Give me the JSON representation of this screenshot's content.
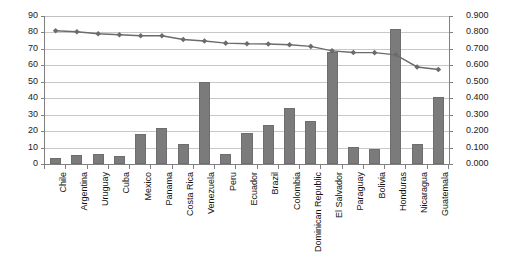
{
  "chart_data": {
    "type": "bar",
    "title": "",
    "subtitle": "",
    "xlabel": "",
    "ylabel": "",
    "grid": true,
    "legend": "none",
    "categories": [
      "Chile",
      "Argentina",
      "Uruguay",
      "Cuba",
      "Mexico",
      "Panama",
      "Costa Rica",
      "Venezuela",
      "Peru",
      "Ecuador",
      "Brazil",
      "Colombia",
      "Dominican Republic",
      "El Salvador",
      "Paraguay",
      "Bolivia",
      "Honduras",
      "Nicaragua",
      "Guatemala"
    ],
    "axes": {
      "left": {
        "min": 0,
        "max": 90,
        "step": 10,
        "ticks": [
          "0",
          "10",
          "20",
          "30",
          "40",
          "50",
          "60",
          "70",
          "80",
          "90"
        ]
      },
      "right": {
        "min": 0.0,
        "max": 0.9,
        "step": 0.1,
        "ticks": [
          "0.000",
          "0.100",
          "0.200",
          "0.300",
          "0.400",
          "0.500",
          "0.600",
          "0.700",
          "0.800",
          "0.900"
        ]
      }
    },
    "series": [
      {
        "name": "bars",
        "type": "bar",
        "axis": "left",
        "color": "#7b7b7b",
        "values": [
          3.4,
          5.5,
          6.3,
          4.9,
          18.5,
          22.0,
          12.0,
          49.7,
          6.0,
          19.1,
          23.6,
          34.1,
          26.0,
          68.0,
          10.4,
          8.9,
          82.0,
          12.4,
          41.0
        ]
      },
      {
        "name": "line",
        "type": "line",
        "axis": "right",
        "color": "#6b6b6b",
        "marker": "diamond",
        "values": [
          0.81,
          0.804,
          0.792,
          0.786,
          0.78,
          0.78,
          0.757,
          0.748,
          0.735,
          0.731,
          0.73,
          0.725,
          0.715,
          0.688,
          0.678,
          0.677,
          0.664,
          0.59,
          0.575
        ]
      }
    ]
  }
}
